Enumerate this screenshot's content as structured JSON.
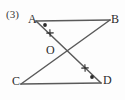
{
  "figure": {
    "problem_number": "(3)",
    "type": "geometry-diagram",
    "stroke_color": "#5a5a5a",
    "mark_color": "#2b2b2b",
    "background_color": "#fdfdfd",
    "points": [
      {
        "id": "A",
        "label": "A",
        "x": 36,
        "y": 21,
        "label_x": 28,
        "label_y": 13
      },
      {
        "id": "B",
        "label": "B",
        "x": 110,
        "y": 20,
        "label_x": 111,
        "label_y": 13
      },
      {
        "id": "C",
        "label": "C",
        "x": 21,
        "y": 84,
        "label_x": 12,
        "label_y": 75
      },
      {
        "id": "D",
        "label": "D",
        "x": 101,
        "y": 83,
        "label_x": 103,
        "label_y": 74
      },
      {
        "id": "O",
        "label": "O",
        "x": 68,
        "y": 55,
        "label_x": 46,
        "label_y": 44
      }
    ],
    "segments": [
      {
        "name": "AB",
        "from": "A",
        "to": "B",
        "x1": 36,
        "y1": 21,
        "x2": 110,
        "y2": 20
      },
      {
        "name": "CD",
        "from": "C",
        "to": "D",
        "x1": 21,
        "y1": 84,
        "x2": 101,
        "y2": 83
      },
      {
        "name": "AD",
        "from": "A",
        "to": "D",
        "x1": 36,
        "y1": 21,
        "x2": 101,
        "y2": 83
      },
      {
        "name": "BC",
        "from": "B",
        "to": "C",
        "x1": 110,
        "y1": 20,
        "x2": 21,
        "y2": 84
      }
    ],
    "marks": [
      {
        "name": "angle-dot-A",
        "kind": "dot",
        "at": "A",
        "x": 45,
        "y": 25
      },
      {
        "name": "angle-dot-D",
        "kind": "dot",
        "at": "D",
        "x": 92,
        "y": 77
      },
      {
        "name": "tick-x-AO",
        "kind": "x-tick",
        "on": "AO",
        "x": 50,
        "y": 33,
        "angle": 43
      },
      {
        "name": "tick-x-OD",
        "kind": "x-tick",
        "on": "OD",
        "x": 85,
        "y": 68,
        "angle": 43
      }
    ]
  }
}
